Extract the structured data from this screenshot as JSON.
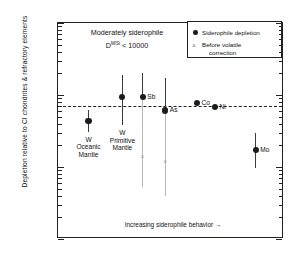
{
  "chart_data": {
    "type": "scatter",
    "title": "",
    "xlabel": "Increasing siderophile behavior  →",
    "ylabel": "Depletion relative to CI chondrites & refractory elements",
    "yscale": "log",
    "ylim": [
      0.001,
      1
    ],
    "ytick_labels": [
      "1",
      "0.1",
      "0.01",
      "0.001"
    ],
    "ytick_values": [
      1,
      0.1,
      0.01,
      0.001
    ],
    "grid": false,
    "legend_position": "top-right",
    "reference_line": {
      "value": 0.07,
      "style": "dashed"
    },
    "annotation_title_line1": "Moderately siderophile",
    "annotation_title_line2_prefix": "D",
    "annotation_title_line2_sup": "M/Si",
    "annotation_title_line2_suffix": " < 10000",
    "legend": [
      {
        "marker": "filled-circle",
        "label": "Siderophile depletion"
      },
      {
        "marker": "cross",
        "label": "Before volatile\ncorrection",
        "label_line1": "Before volatile",
        "label_line2": "correction"
      }
    ],
    "series": [
      {
        "name": "Siderophile depletion",
        "marker": "filled-circle",
        "points": [
          {
            "label": "W\nOceanic\nMantle",
            "label_lines": [
              "W",
              "Oceanic",
              "Mantle"
            ],
            "x": 1,
            "value": 0.044,
            "err_low": 0.031,
            "err_high": 0.062,
            "label_pos": "below"
          },
          {
            "label": "W\nPrimitive\nMantle",
            "label_lines": [
              "W",
              "Primitive",
              "Mantle"
            ],
            "x": 2,
            "value": 0.094,
            "err_low": 0.038,
            "err_high": 0.19,
            "label_pos": "below"
          },
          {
            "label": "Sb",
            "label_lines": [
              "Sb"
            ],
            "x": 3,
            "value": 0.095,
            "err_low": 0.0052,
            "err_high": 0.2,
            "label_pos": "right"
          },
          {
            "label": "As",
            "label_lines": [
              "As"
            ],
            "x": 4,
            "value": 0.061,
            "err_low": 0.004,
            "err_high": 0.175,
            "label_pos": "right"
          },
          {
            "label": "Co",
            "label_lines": [
              "Co"
            ],
            "x": 5,
            "value": 0.078,
            "err_low": 0.074,
            "err_high": 0.082,
            "label_pos": "right"
          },
          {
            "label": "Ni",
            "label_lines": [
              "Ni"
            ],
            "x": 6,
            "value": 0.068,
            "err_low": 0.064,
            "err_high": 0.072,
            "label_pos": "right"
          },
          {
            "label": "Mo",
            "label_lines": [
              "Mo"
            ],
            "x": 7,
            "value": 0.017,
            "err_low": 0.0098,
            "err_high": 0.03,
            "label_pos": "right"
          }
        ]
      },
      {
        "name": "Before volatile correction",
        "marker": "cross",
        "points": [
          {
            "label": "Sb (uncorrected)",
            "x": 3,
            "value": 0.0135
          },
          {
            "label": "As (uncorrected)",
            "x": 4,
            "value": 0.0115
          }
        ]
      }
    ]
  }
}
